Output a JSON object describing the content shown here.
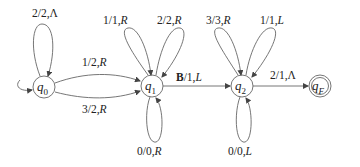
{
  "diagram": {
    "type": "turing-machine-state-diagram",
    "states": [
      {
        "id": "q0",
        "name": "q",
        "sub": "0",
        "initial": true,
        "accepting": false
      },
      {
        "id": "q1",
        "name": "q",
        "sub": "1",
        "initial": false,
        "accepting": false
      },
      {
        "id": "q2",
        "name": "q",
        "sub": "2",
        "initial": false,
        "accepting": false
      },
      {
        "id": "qF",
        "name": "q",
        "sub": "F",
        "initial": false,
        "accepting": true
      }
    ],
    "transitions": [
      {
        "from": "q0",
        "to": "q0",
        "read": "2",
        "write": "2",
        "move": "Λ",
        "label_prefix": "2/2,",
        "label_move": "Λ"
      },
      {
        "from": "q0",
        "to": "q1",
        "read": "1",
        "write": "2",
        "move": "R",
        "label_prefix": "1/2,",
        "label_move": "R"
      },
      {
        "from": "q0",
        "to": "q1",
        "read": "3",
        "write": "2",
        "move": "R",
        "label_prefix": "3/2,",
        "label_move": "R"
      },
      {
        "from": "q1",
        "to": "q1",
        "read": "1",
        "write": "1",
        "move": "R",
        "label_prefix": "1/1,",
        "label_move": "R"
      },
      {
        "from": "q1",
        "to": "q1",
        "read": "2",
        "write": "2",
        "move": "R",
        "label_prefix": "2/2,",
        "label_move": "R"
      },
      {
        "from": "q1",
        "to": "q1",
        "read": "0",
        "write": "0",
        "move": "R",
        "label_prefix": "0/0,",
        "label_move": "R"
      },
      {
        "from": "q1",
        "to": "q2",
        "read": "B",
        "write": "1",
        "move": "L",
        "label_bold": "B",
        "label_prefix": "/1,",
        "label_move": "L"
      },
      {
        "from": "q2",
        "to": "q2",
        "read": "3",
        "write": "3",
        "move": "R",
        "label_prefix": "3/3,",
        "label_move": "R"
      },
      {
        "from": "q2",
        "to": "q2",
        "read": "1",
        "write": "1",
        "move": "L",
        "label_prefix": "1/1,",
        "label_move": "L"
      },
      {
        "from": "q2",
        "to": "q2",
        "read": "0",
        "write": "0",
        "move": "L",
        "label_prefix": "0/0,",
        "label_move": "L"
      },
      {
        "from": "q2",
        "to": "qF",
        "read": "2",
        "write": "1",
        "move": "Λ",
        "label_prefix": "2/1,",
        "label_move": "Λ"
      }
    ]
  },
  "colors": {
    "stroke": "#555555",
    "text": "#222222",
    "background": "#ffffff"
  }
}
